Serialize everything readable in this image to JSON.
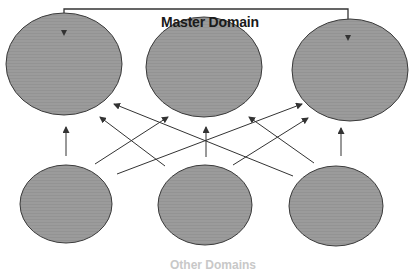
{
  "diagram": {
    "title": "Master Domain",
    "caption": "Other Domains",
    "colors": {
      "node_fill": "#9a9a9a",
      "node_stroke": "#3a3a3a",
      "arrow": "#333333",
      "title_text": "#1a1a1a"
    },
    "top_nodes": [
      {
        "id": "master-left",
        "cx": 64,
        "cy": 64,
        "rx": 58,
        "ry": 51
      },
      {
        "id": "master-middle",
        "cx": 204,
        "cy": 67,
        "rx": 58,
        "ry": 50
      },
      {
        "id": "master-right",
        "cx": 350,
        "cy": 70,
        "rx": 58,
        "ry": 51
      }
    ],
    "bottom_nodes": [
      {
        "id": "other-left",
        "cx": 66,
        "cy": 204,
        "rx": 46,
        "ry": 39
      },
      {
        "id": "other-middle",
        "cx": 205,
        "cy": 205,
        "rx": 47,
        "ry": 40
      },
      {
        "id": "other-right",
        "cx": 336,
        "cy": 206,
        "rx": 47,
        "ry": 40
      }
    ],
    "bracket": {
      "x1": 64,
      "x2": 348,
      "y_top": 9,
      "y_left_end": 36,
      "y_right_end": 41
    },
    "arrows": [
      {
        "from": "other-left",
        "to": "master-left",
        "x1": 66,
        "y1": 156,
        "x2": 66,
        "y2": 127
      },
      {
        "from": "other-left",
        "to": "master-middle",
        "x1": 95,
        "y1": 164,
        "x2": 168,
        "y2": 117
      },
      {
        "from": "other-left",
        "to": "master-right",
        "x1": 117,
        "y1": 174,
        "x2": 302,
        "y2": 104
      },
      {
        "from": "other-middle",
        "to": "master-left",
        "x1": 165,
        "y1": 166,
        "x2": 100,
        "y2": 117
      },
      {
        "from": "other-middle",
        "to": "master-middle",
        "x1": 206,
        "y1": 157,
        "x2": 206,
        "y2": 127
      },
      {
        "from": "other-middle",
        "to": "master-right",
        "x1": 233,
        "y1": 165,
        "x2": 308,
        "y2": 118
      },
      {
        "from": "other-right",
        "to": "master-left",
        "x1": 293,
        "y1": 176,
        "x2": 114,
        "y2": 104
      },
      {
        "from": "other-right",
        "to": "master-middle",
        "x1": 314,
        "y1": 163,
        "x2": 249,
        "y2": 117
      },
      {
        "from": "other-right",
        "to": "master-right",
        "x1": 341,
        "y1": 156,
        "x2": 341,
        "y2": 128
      }
    ]
  }
}
